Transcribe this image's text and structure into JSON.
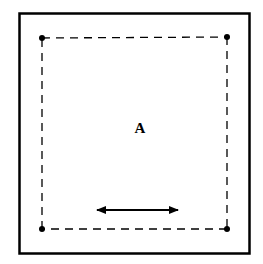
{
  "diagram": {
    "region_label": "A",
    "outer_border": {
      "x": 19,
      "y": 13,
      "width": 231,
      "height": 241,
      "stroke": "#000000",
      "stroke_width": 2.5
    },
    "inner_dashed_box": {
      "x1": 42,
      "y1": 38,
      "x2": 227,
      "y2": 229,
      "stroke": "#000000",
      "dash": "8 6"
    },
    "corner_points": [
      {
        "name": "top-left",
        "x": 42,
        "y": 38
      },
      {
        "name": "top-right",
        "x": 227,
        "y": 37
      },
      {
        "name": "bottom-left",
        "x": 42,
        "y": 229
      },
      {
        "name": "bottom-right",
        "x": 227,
        "y": 229
      }
    ],
    "double_arrow": {
      "x1": 96,
      "x2": 179,
      "y": 210
    }
  }
}
